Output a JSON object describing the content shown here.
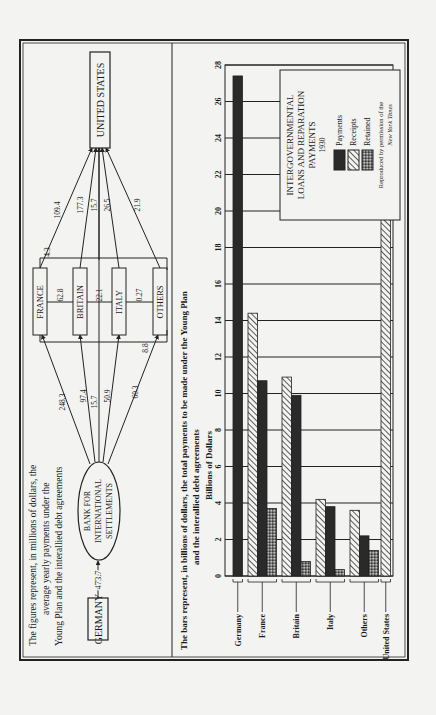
{
  "diagram": {
    "caption_lines": [
      "The figures represent, in millions of dollars, the",
      "average yearly payments under the",
      "Young Plan and the interallied debt agreements"
    ],
    "nodes": {
      "germany": "GERMANY",
      "bis": [
        "BANK FOR",
        "INTERNATIONAL",
        "SETTLEMENTS"
      ],
      "france": "FRANCE",
      "britain": "BRITAIN",
      "italy": "ITALY",
      "others": "OTHERS",
      "united_states": "UNITED STATES"
    },
    "flows": {
      "germany_to_bis": "473.7",
      "bis_to_france": "248.3",
      "bis_to_britain": "97.4",
      "bis_to_us": "15.7",
      "bis_to_italy": "50.9",
      "bis_to_others": "60.3",
      "france_britain": "62.8",
      "britain_italy": "22.1",
      "italy_others": "0.27",
      "others_to_france_lower": "8.8",
      "others_to_france_upper": "4.3",
      "france_to_us": "109.4",
      "britain_to_us": "177.3",
      "bis_direct_to_us": "15.7",
      "italy_to_us": "26.5",
      "others_to_us": "21.9"
    }
  },
  "chart": {
    "caption_lines": [
      "The bars represent, in billions of dollars, the total payments to be made under the Young Plan",
      "and the interallied debt agreements"
    ],
    "axis_label": "Billions of Dollars",
    "ticks": [
      "0",
      "2",
      "4",
      "6",
      "8",
      "10",
      "12",
      "14",
      "16",
      "18",
      "20",
      "22",
      "24",
      "26",
      "28"
    ],
    "legend": {
      "title_lines": [
        "INTERGOVERNMENTAL",
        "LOANS AND REPARATION",
        "PAYMENTS",
        "1930"
      ],
      "items": [
        "Payments",
        "Receipts",
        "Retained"
      ],
      "credit_lines": [
        "Reproduced by permission of the",
        "New York Times"
      ]
    }
  },
  "chart_data": {
    "type": "bar",
    "title": "Intergovernmental Loans and Reparation Payments 1930",
    "subtitle": "The bars represent, in billions of dollars, the total payments to be made under the Young Plan and the interallied debt agreements",
    "xlabel": "",
    "ylabel": "Billions of Dollars",
    "ylim": [
      0,
      28
    ],
    "orientation": "vertical (page rotated 90°)",
    "grid": true,
    "legend_position": "upper right",
    "categories": [
      "Germany",
      "France",
      "Britain",
      "Italy",
      "Others",
      "United States"
    ],
    "series": [
      {
        "name": "Payments",
        "pattern": "solid dark",
        "values": [
          27.4,
          10.7,
          9.9,
          3.8,
          2.2,
          null
        ]
      },
      {
        "name": "Receipts",
        "pattern": "diagonal hatch",
        "values": [
          null,
          14.4,
          10.9,
          4.2,
          3.6,
          21.2
        ]
      },
      {
        "name": "Retained",
        "pattern": "cross hatch",
        "values": [
          null,
          3.7,
          0.8,
          0.35,
          1.4,
          null
        ]
      }
    ]
  }
}
